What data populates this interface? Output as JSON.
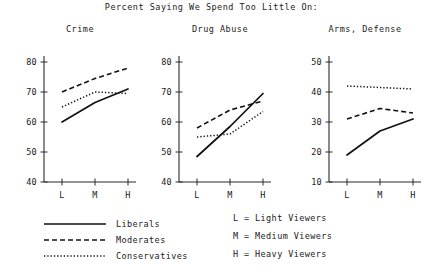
{
  "chart_data": {
    "type": "line",
    "title": "Percent Saying We Spend Too Little On:",
    "xlabel": "",
    "ylabel": "",
    "grid": false,
    "legend_position": "bottom-left",
    "x": [
      "L",
      "M",
      "H"
    ],
    "x_tick_labels": [
      "L",
      "M",
      "H"
    ],
    "legend_entries": [
      {
        "name": "Liberals",
        "style": "solid"
      },
      {
        "name": "Moderates",
        "style": "dashed"
      },
      {
        "name": "Conservatives",
        "style": "dotted"
      }
    ],
    "panels": [
      {
        "title": "Crime",
        "ylim": [
          40,
          80
        ],
        "y_tick_labels": [
          "40",
          "50",
          "60",
          "70",
          "80"
        ],
        "y_ticks": [
          40,
          50,
          60,
          70,
          80
        ],
        "series": [
          {
            "name": "Liberals",
            "style": "solid",
            "values": [
              60.0,
              66.5,
              71.0
            ]
          },
          {
            "name": "Moderates",
            "style": "dashed",
            "values": [
              70.0,
              74.5,
              78.0
            ]
          },
          {
            "name": "Conservatives",
            "style": "dotted",
            "values": [
              65.0,
              70.0,
              69.5
            ]
          }
        ]
      },
      {
        "title": "Drug Abuse",
        "ylim": [
          40,
          80
        ],
        "y_tick_labels": [
          "40",
          "50",
          "60",
          "70",
          "80"
        ],
        "y_ticks": [
          40,
          50,
          60,
          70,
          80
        ],
        "series": [
          {
            "name": "Liberals",
            "style": "solid",
            "values": [
              48.5,
              58.5,
              69.5
            ]
          },
          {
            "name": "Moderates",
            "style": "dashed",
            "values": [
              58.0,
              64.0,
              67.0
            ]
          },
          {
            "name": "Conservatives",
            "style": "dotted",
            "values": [
              55.0,
              56.0,
              63.5
            ]
          }
        ]
      },
      {
        "title": "Arms, Defense",
        "ylim": [
          10,
          50
        ],
        "y_tick_labels": [
          "10",
          "20",
          "30",
          "40",
          "50"
        ],
        "y_ticks": [
          10,
          20,
          30,
          40,
          50
        ],
        "series": [
          {
            "name": "Liberals",
            "style": "solid",
            "values": [
              19.0,
              27.0,
              31.0
            ]
          },
          {
            "name": "Moderates",
            "style": "dashed",
            "values": [
              31.0,
              34.5,
              33.0
            ]
          },
          {
            "name": "Conservatives",
            "style": "dotted",
            "values": [
              42.0,
              41.5,
              41.0
            ]
          }
        ]
      }
    ],
    "annotations": [
      "L = Light Viewers",
      "M = Medium Viewers",
      "H = Heavy Viewers"
    ]
  },
  "viewer_key": {
    "light": "L = Light Viewers",
    "medium": "M = Medium Viewers",
    "heavy": "H = Heavy Viewers"
  },
  "colors": {
    "ink": "#111111",
    "axis": "#2b2b2b",
    "background": "#ffffff"
  }
}
